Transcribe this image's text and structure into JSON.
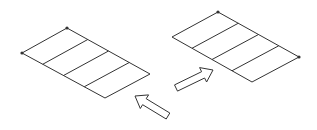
{
  "diagram": {
    "width": 317,
    "height": 130,
    "stroke_color": "#333333",
    "fill_color": "#ffffff",
    "panels": [
      {
        "name": "left-panel",
        "corners": {
          "left": [
            22,
            53
          ],
          "top": [
            67,
            28
          ],
          "right": [
            150,
            74
          ],
          "bottom": [
            105,
            98
          ]
        },
        "dividers": 3,
        "dot_corners": [
          "left",
          "top"
        ]
      },
      {
        "name": "right-panel",
        "corners": {
          "left": [
            172,
            37
          ],
          "top": [
            218,
            12
          ],
          "right": [
            299,
            57
          ],
          "bottom": [
            252,
            82
          ]
        },
        "dividers": 3,
        "dot_corners": [
          "top",
          "right"
        ]
      }
    ],
    "arrows": [
      {
        "name": "arrow-up-left",
        "tail": [
          168,
          116
        ],
        "head": [
          135,
          96
        ]
      },
      {
        "name": "arrow-up-right",
        "tail": [
          176,
          88
        ],
        "head": [
          213,
          70
        ]
      }
    ]
  }
}
